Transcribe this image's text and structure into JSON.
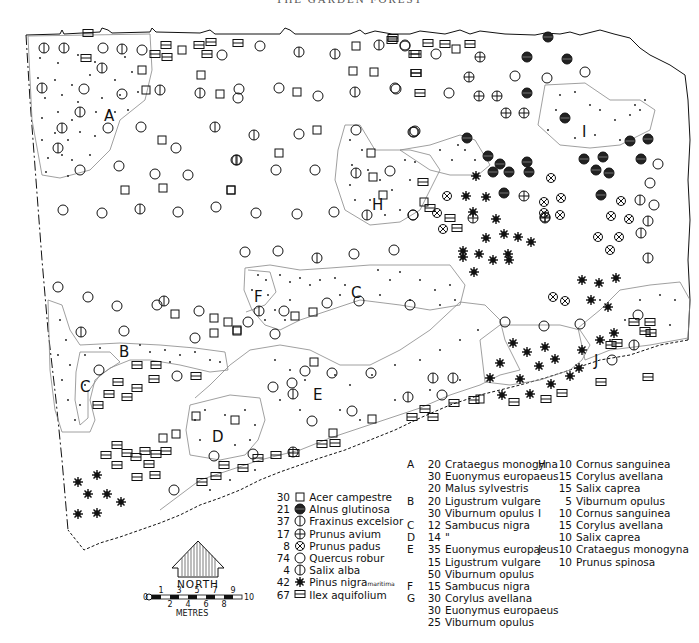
{
  "title": "THE GARDEN FOREST",
  "map": {
    "zone_labels": [
      {
        "id": "A",
        "x": 104,
        "y": 116
      },
      {
        "id": "B",
        "x": 124,
        "y": 353
      },
      {
        "id": "C",
        "x": 88,
        "y": 385
      },
      {
        "id": "C",
        "x": 357,
        "y": 293
      },
      {
        "id": "D",
        "x": 219,
        "y": 437
      },
      {
        "id": "E",
        "x": 318,
        "y": 395
      },
      {
        "id": "F",
        "x": 259,
        "y": 298
      },
      {
        "id": "H",
        "x": 378,
        "y": 207
      },
      {
        "id": "I",
        "x": 585,
        "y": 134
      },
      {
        "id": "J",
        "x": 599,
        "y": 362
      }
    ]
  },
  "legend_species": [
    {
      "count": "30",
      "symbol": "square",
      "name": "Acer campestre"
    },
    {
      "count": "21",
      "symbol": "filled-circle",
      "name": "Alnus glutinosa"
    },
    {
      "count": "37",
      "symbol": "circle-vbar",
      "name": "Fraxinus excelsior"
    },
    {
      "count": "17",
      "symbol": "circle-plus",
      "name": "Prunus avium"
    },
    {
      "count": "8",
      "symbol": "circle-x",
      "name": "Prunus padus"
    },
    {
      "count": "74",
      "symbol": "circle",
      "name": "Quercus robur"
    },
    {
      "count": "4",
      "symbol": "circle-vbar-large",
      "name": "Salix alba"
    },
    {
      "count": "42",
      "symbol": "star",
      "name": "Pinus nigra",
      "suffix": "maritima"
    },
    {
      "count": "67",
      "symbol": "square-hbar",
      "name": "Ilex aquifolium"
    }
  ],
  "legend_zones_1": [
    {
      "zone": "A",
      "count": "20",
      "name": "Crataegus monogyna"
    },
    {
      "zone": "",
      "count": "30",
      "name": "Euonymus europaeus"
    },
    {
      "zone": "",
      "count": "20",
      "name": "Malus sylvestris"
    },
    {
      "zone": "B",
      "count": "20",
      "name": "Ligustrum vulgare"
    },
    {
      "zone": "",
      "count": "30",
      "name": "Viburnum opulus"
    },
    {
      "zone": "C",
      "count": "12",
      "name": "Sambucus nigra"
    },
    {
      "zone": "D",
      "count": "14",
      "name": "\""
    },
    {
      "zone": "E",
      "count": "35",
      "name": "Euonymus europaeus"
    },
    {
      "zone": "",
      "count": "15",
      "name": "Ligustrum vulgare"
    },
    {
      "zone": "",
      "count": "50",
      "name": "Viburnum opulus"
    },
    {
      "zone": "F",
      "count": "15",
      "name": "Sambucus nigra"
    },
    {
      "zone": "G",
      "count": "30",
      "name": "Corylus avellana"
    },
    {
      "zone": "",
      "count": "30",
      "name": "Euonymus europaeus"
    },
    {
      "zone": "",
      "count": "25",
      "name": "Viburnum opulus"
    }
  ],
  "legend_zones_2": [
    {
      "zone": "H",
      "count": "10",
      "name": "Cornus sanguinea"
    },
    {
      "zone": "",
      "count": "15",
      "name": "Corylus avellana"
    },
    {
      "zone": "",
      "count": "15",
      "name": "Salix caprea"
    },
    {
      "zone": "",
      "count": "5",
      "name": "Viburnum opulus"
    },
    {
      "zone": "I",
      "count": "10",
      "name": "Cornus sanguinea"
    },
    {
      "zone": "",
      "count": "15",
      "name": "Corylus avellana"
    },
    {
      "zone": "",
      "count": "10",
      "name": "Salix caprea"
    },
    {
      "zone": "J",
      "count": "10",
      "name": "Crataegus monogyna"
    },
    {
      "zone": "",
      "count": "10",
      "name": "Prunus spinosa"
    }
  ],
  "north_arrow": {
    "label": "NORTH"
  },
  "scale_bar": {
    "unit_label": "METRES",
    "start": "0",
    "end": "10",
    "top_ticks": [
      "1",
      "3",
      "5",
      "7",
      "9"
    ],
    "bottom_ticks": [
      "2",
      "4",
      "6",
      "8"
    ]
  }
}
